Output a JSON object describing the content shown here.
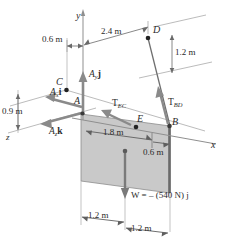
{
  "figure": {
    "type": "engineering-statics-free-body-diagram",
    "colors": {
      "plate_fill": "#c9c9c9",
      "plate_edge": "#6e6e6e",
      "arrow_gray": "#8a8a8a",
      "line_gray": "#9a9a9a",
      "text": "#2b2b2b",
      "dark_edge": "#5a5a5a",
      "background": "#ffffff"
    }
  },
  "axes": {
    "x_label": "x",
    "y_label": "y",
    "z_label": "z"
  },
  "points": {
    "A": "A",
    "B": "B",
    "C": "C",
    "D": "D",
    "E": "E"
  },
  "dimensions": {
    "top_left": "0.6 m",
    "top_span": "2.4 m",
    "right_vertical": "1.2 m",
    "left_vertical": "0.9 m",
    "plate_width": "1.8 m",
    "plate_offset": "0.6 m",
    "bottom_left": "1.2 m",
    "bottom_right": "1.2 m"
  },
  "forces": {
    "reaction_x": {
      "symbol": "A",
      "subscript": "x",
      "unit_vector": "i"
    },
    "reaction_y": {
      "symbol": "A",
      "subscript": "y",
      "unit_vector": "j"
    },
    "reaction_z": {
      "symbol": "A",
      "subscript": "z",
      "unit_vector": "k"
    },
    "tension_ec": {
      "symbol": "T",
      "subscript": "EC"
    },
    "tension_bd": {
      "symbol": "T",
      "subscript": "BD"
    },
    "weight": "W = – (540 N) j"
  }
}
